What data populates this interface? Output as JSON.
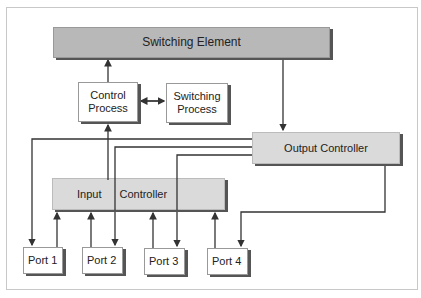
{
  "diagram": {
    "nodes": {
      "switching_element": "Switching Element",
      "control_process_line1": "Control",
      "control_process_line2": "Process",
      "switching_process_line1": "Switching",
      "switching_process_line2": "Process",
      "output_controller": "Output Controller",
      "input_controller_part1": "Input",
      "input_controller_part2": "Controller",
      "ports": [
        "Port 1",
        "Port 2",
        "Port 3",
        "Port 4"
      ]
    },
    "edges": [
      {
        "from": "Control Process",
        "to": "Switching Element"
      },
      {
        "from": "Control Process",
        "to": "Switching Process",
        "bidirectional": true
      },
      {
        "from": "Switching Element",
        "to": "Output Controller"
      },
      {
        "from": "Input Controller",
        "to": "Control Process"
      },
      {
        "from": "Output Controller",
        "to": "Port 1"
      },
      {
        "from": "Output Controller",
        "to": "Port 2"
      },
      {
        "from": "Output Controller",
        "to": "Port 3"
      },
      {
        "from": "Output Controller",
        "to": "Port 4"
      },
      {
        "from": "Port 1",
        "to": "Input Controller"
      },
      {
        "from": "Port 2",
        "to": "Input Controller"
      },
      {
        "from": "Port 3",
        "to": "Input Controller"
      },
      {
        "from": "Port 4",
        "to": "Input Controller"
      }
    ]
  }
}
